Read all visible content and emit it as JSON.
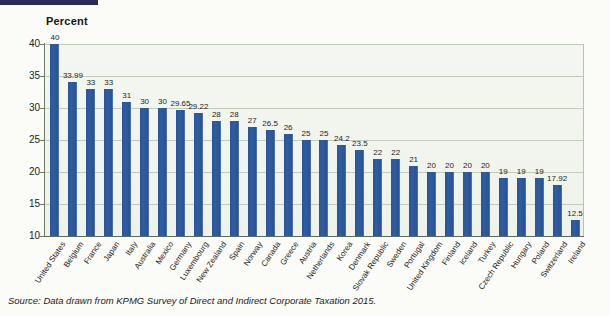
{
  "header": {
    "y_axis_title": "Percent"
  },
  "source": {
    "prefix": "Source:",
    "text": " Data drawn from KPMG Survey of Direct and Indirect Corporate Taxation 2015."
  },
  "colors": {
    "bar": "#2c5496",
    "top_rule": "#2b2d57",
    "grid": "#c2cbbb",
    "plot_bg": "#f1f5ee"
  },
  "chart_data": {
    "type": "bar",
    "title": "",
    "subtitle": "",
    "xlabel": "",
    "ylabel": "Percent",
    "ylim": [
      10,
      40
    ],
    "yticks": [
      10,
      15,
      20,
      25,
      30,
      35,
      40
    ],
    "grid": true,
    "legend": "none",
    "value_labels": true,
    "categories": [
      "United States",
      "Belgium",
      "France",
      "Japan",
      "Italy",
      "Australia",
      "Mexico",
      "Germany",
      "Luxembourg",
      "New Zealand",
      "Spain",
      "Norway",
      "Canada",
      "Greece",
      "Austria",
      "Netherlands",
      "Korea",
      "Denmark",
      "Slovak Republic",
      "Sweden",
      "Portugal",
      "United Kingdom",
      "Finland",
      "Iceland",
      "Turkey",
      "Czech Republic",
      "Hungary",
      "Poland",
      "Switzerland",
      "Ireland"
    ],
    "values": [
      40,
      33.99,
      33,
      33,
      31,
      30,
      30,
      29.65,
      29.22,
      28,
      28,
      27,
      26.5,
      26,
      25,
      25,
      24.2,
      23.5,
      22,
      22,
      21,
      20,
      20,
      20,
      20,
      19,
      19,
      19,
      17.92,
      12.5
    ],
    "value_label_text": [
      "40",
      "33.99",
      "33",
      "33",
      "31",
      "30",
      "30",
      "29.65",
      "29.22",
      "28",
      "28",
      "27",
      "26.5",
      "26",
      "25",
      "25",
      "24.2",
      "23.5",
      "22",
      "22",
      "21",
      "20",
      "20",
      "20",
      "20",
      "19",
      "19",
      "19",
      "17.92",
      "12.5"
    ]
  }
}
